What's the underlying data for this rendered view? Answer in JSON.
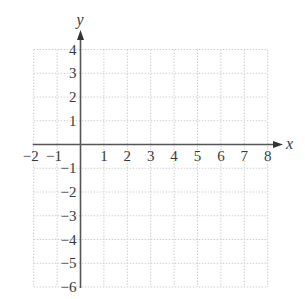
{
  "chart_data": {
    "type": "blank-coordinate-grid",
    "title": "",
    "xlabel": "x",
    "ylabel": "y",
    "xlim": [
      -2,
      8
    ],
    "ylim": [
      -6,
      4
    ],
    "grid": true,
    "grid_style": "dotted",
    "x_ticks": [
      -2,
      -1,
      1,
      2,
      3,
      4,
      5,
      6,
      7,
      8
    ],
    "y_ticks": [
      4,
      3,
      2,
      1,
      -1,
      -2,
      -3,
      -4,
      -5,
      -6
    ],
    "x_tick_labels": [
      "−2",
      "−1",
      "1",
      "2",
      "3",
      "4",
      "5",
      "6",
      "7",
      "8"
    ],
    "y_tick_labels": [
      "4",
      "3",
      "2",
      "1",
      "−1",
      "−2",
      "−3",
      "−4",
      "−5",
      "−6"
    ],
    "series": []
  },
  "colors": {
    "axis": "#555555",
    "grid": "#cfcfcf",
    "text": "#3a3a3a"
  },
  "layout": {
    "origin_px": [
      80.5,
      144.5
    ],
    "unit_px_x": 23.4,
    "unit_px_y": 23.75,
    "x_arrow_end_px": 283,
    "y_arrow_end_px": 30
  }
}
